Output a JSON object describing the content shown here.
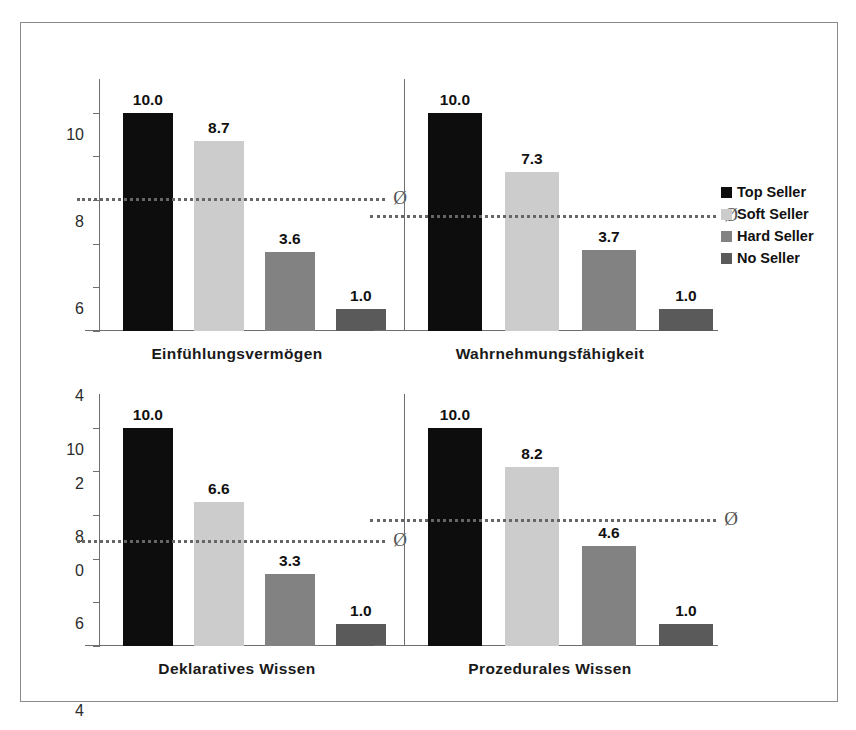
{
  "chart_data": {
    "type": "bar",
    "title": "",
    "xlabel": "",
    "ylabel": "",
    "ylim": [
      0,
      11
    ],
    "yticks": [
      0,
      2,
      4,
      6,
      8,
      10
    ],
    "ytick_labels": [
      "0",
      "2",
      "4",
      "6",
      "8",
      "10"
    ],
    "grid": false,
    "legend_position": "right",
    "categories": [
      "Top Seller",
      "Soft Seller",
      "Hard Seller",
      "No Seller"
    ],
    "series_colors": [
      "#0d0d0d",
      "#cccccc",
      "#828282",
      "#5a5a5a"
    ],
    "average_symbol": "Ø",
    "panels": [
      {
        "name": "Einfühlungsvermögen",
        "values": [
          10.0,
          8.7,
          3.6,
          1.0
        ],
        "value_labels": [
          "10.0",
          "8.7",
          "3.6",
          "1.0"
        ],
        "average": 6.1,
        "show_yaxis_labels": true
      },
      {
        "name": "Wahrnehmungsfähigkeit",
        "values": [
          10.0,
          7.3,
          3.7,
          1.0
        ],
        "value_labels": [
          "10.0",
          "7.3",
          "3.7",
          "1.0"
        ],
        "average": 5.3,
        "show_yaxis_labels": false
      },
      {
        "name": "Deklaratives Wissen",
        "values": [
          10.0,
          6.6,
          3.3,
          1.0
        ],
        "value_labels": [
          "10.0",
          "6.6",
          "3.3",
          "1.0"
        ],
        "average": 4.85,
        "show_yaxis_labels": true
      },
      {
        "name": "Prozedurales Wissen",
        "values": [
          10.0,
          8.2,
          4.6,
          1.0
        ],
        "value_labels": [
          "10.0",
          "8.2",
          "4.6",
          "1.0"
        ],
        "average": 5.8,
        "show_yaxis_labels": false
      }
    ]
  },
  "legend": {
    "items": [
      {
        "label": "Top Seller",
        "color": "#0d0d0d",
        "swatch": "square-swatch"
      },
      {
        "label": "Soft Seller",
        "color": "#cccccc",
        "swatch": "square-swatch"
      },
      {
        "label": "Hard Seller",
        "color": "#828282",
        "swatch": "square-swatch"
      },
      {
        "label": "No Seller",
        "color": "#5a5a5a",
        "swatch": "square-swatch"
      }
    ]
  }
}
